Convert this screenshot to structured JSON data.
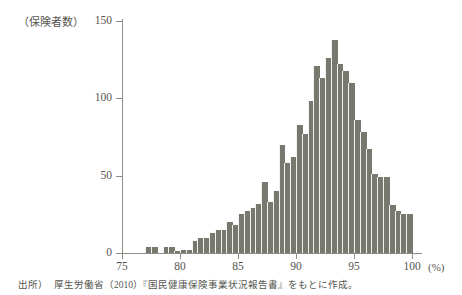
{
  "figure": {
    "y_unit_label": "（保険者数）",
    "x_unit_label": "(%)",
    "source_note_label": "出所）",
    "source_note_text": "厚生労働省（2010）『国民健康保険事業状況報告書』をもとに作成。"
  },
  "colors": {
    "bar": "#78786f",
    "axis": "#8e8e86",
    "text": "#55554f",
    "background": "#ffffff"
  },
  "chart_data": {
    "type": "bar",
    "title": "",
    "subtitle": "",
    "xlabel": "(%)",
    "ylabel": "（保険者数）",
    "xlim": [
      74.0,
      101.0
    ],
    "ylim": [
      0,
      150
    ],
    "grid": false,
    "legend": false,
    "bin_width": 0.5,
    "y_ticks": [
      0,
      50,
      100,
      150
    ],
    "y_tick_labels": [
      "0",
      "50",
      "100",
      "150"
    ],
    "x_ticks": [
      75,
      80,
      85,
      90,
      95,
      100
    ],
    "x_tick_labels": [
      "75",
      "80",
      "85",
      "90",
      "95",
      "100"
    ],
    "categories": [
      "77.0",
      "77.5",
      "78.5",
      "79.0",
      "79.5",
      "80.0",
      "80.5",
      "81.0",
      "81.5",
      "82.0",
      "82.5",
      "83.0",
      "83.5",
      "84.0",
      "84.5",
      "85.0",
      "85.5",
      "86.0",
      "86.5",
      "87.0",
      "87.5",
      "88.0",
      "88.5",
      "89.0",
      "89.5",
      "90.0",
      "90.5",
      "91.0",
      "91.5",
      "92.0",
      "92.5",
      "93.0",
      "93.5",
      "94.0",
      "94.5",
      "95.0",
      "95.5",
      "96.0",
      "96.5",
      "97.0",
      "97.5",
      "98.0",
      "98.5",
      "99.0",
      "99.5"
    ],
    "values": [
      4,
      4,
      4,
      4,
      1,
      2,
      2,
      8,
      10,
      10,
      13,
      15,
      15,
      20,
      18,
      25,
      27,
      29,
      32,
      46,
      33,
      40,
      70,
      58,
      62,
      83,
      77,
      98,
      121,
      113,
      126,
      138,
      122,
      118,
      110,
      86,
      78,
      67,
      51,
      49,
      49,
      31,
      27,
      25,
      25
    ]
  }
}
